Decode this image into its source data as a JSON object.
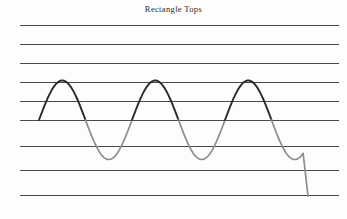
{
  "figure": {
    "title": "Rectangle Tops",
    "canvas": {
      "width": 347,
      "height": 219,
      "background": "#fdfdfc"
    },
    "ruled_lines": {
      "name": "ruled-lines",
      "count": 9,
      "x_start": 20,
      "x_end": 339,
      "color": "#4a4a4a",
      "stroke_width": 1,
      "y_positions": [
        25,
        44,
        63,
        82,
        101,
        120,
        146,
        170,
        195
      ]
    },
    "waveform": {
      "name": "sine-waveform",
      "rising_stroke_color": "#2a2a2a",
      "falling_stroke_color": "#8c8c8c",
      "rising_stroke_width": 1.9,
      "falling_stroke_width": 1.7,
      "baseline_y": 120,
      "peak_y": 41,
      "amplitude": 39.5,
      "period": 93,
      "cycles": 3,
      "x_start": 39,
      "tail_end_x": 308,
      "tail_end_y": 196
    }
  },
  "chart_data": {
    "type": "line",
    "title": "Rectangle Tops",
    "xlabel": "",
    "ylabel": "",
    "grid": true,
    "legend": "none",
    "xlim": [
      20,
      339
    ],
    "ylim": [
      219,
      25
    ],
    "gridlines_y": [
      25,
      44,
      63,
      82,
      101,
      120,
      146,
      170,
      195
    ],
    "series": [
      {
        "name": "rising-edges",
        "color": "#2a2a2a",
        "description": "Upward strokes of three sine cycles",
        "x": [
          39,
          62,
          85,
          132,
          155,
          178,
          225,
          248,
          271
        ],
        "y": [
          120,
          80,
          41,
          120,
          80,
          41,
          120,
          80,
          41
        ]
      },
      {
        "name": "falling-edges",
        "color": "#8c8c8c",
        "description": "Downward strokes of three sine cycles plus straight tail",
        "x": [
          85,
          108,
          132,
          178,
          201,
          225,
          271,
          294,
          308
        ],
        "y": [
          41,
          80,
          120,
          41,
          80,
          120,
          41,
          140,
          196
        ]
      }
    ]
  }
}
